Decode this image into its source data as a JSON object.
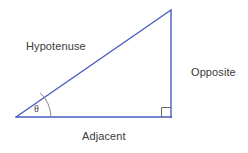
{
  "diagram": {
    "kind": "right-triangle-trigonometry",
    "background_color": "#ffffff",
    "stroke_color": "#4a5bc0",
    "marker_color": "#6b6b6b",
    "label_color": "#3a3a3a",
    "canvas": {
      "width": 248,
      "height": 153
    },
    "vertices": {
      "left_angle_vertex": {
        "x": 16,
        "y": 117
      },
      "apex_vertex": {
        "x": 171,
        "y": 10
      },
      "right_angle_vertex": {
        "x": 171,
        "y": 117
      }
    },
    "sides": [
      {
        "name": "hypotenuse",
        "label": "Hypotenuse",
        "from": "left_angle_vertex",
        "to": "apex_vertex"
      },
      {
        "name": "opposite",
        "label": "Opposite",
        "from": "apex_vertex",
        "to": "right_angle_vertex"
      },
      {
        "name": "adjacent",
        "label": "Adjacent",
        "from": "right_angle_vertex",
        "to": "left_angle_vertex"
      }
    ],
    "angles": [
      {
        "name": "theta",
        "label": "θ",
        "at": "left_angle_vertex",
        "marker": "arc",
        "arc_radius": 35
      },
      {
        "name": "right-angle",
        "label": "",
        "at": "right_angle_vertex",
        "marker": "square",
        "square_size": 9
      }
    ],
    "labels": {
      "hypotenuse": "Hypotenuse",
      "opposite": "Opposite",
      "adjacent": "Adjacent",
      "theta": "θ"
    }
  }
}
